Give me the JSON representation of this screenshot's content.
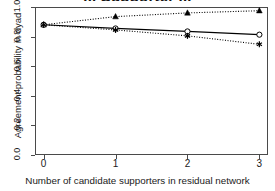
{
  "title": "... Supporter ...",
  "axes": {
    "ylabel": "Agreement probability in dyad",
    "xlabel": "Number of candidate supporters in residual network",
    "y_ticks": [
      "0.0",
      "0.2",
      "0.4",
      "0.6",
      "0.8",
      "1.0"
    ],
    "x_ticks": [
      "0",
      "1",
      "2",
      "3"
    ]
  },
  "chart_data": {
    "type": "line",
    "title": "... Supporter ...",
    "xlabel": "Number of candidate supporters in residual network",
    "ylabel": "Agreement probability in dyad",
    "x": [
      0,
      1,
      2,
      3
    ],
    "xlim": [
      -0.12,
      3.12
    ],
    "ylim": [
      0.0,
      1.0
    ],
    "xticks": [
      0,
      1,
      2,
      3
    ],
    "yticks": [
      0.0,
      0.2,
      0.4,
      0.6,
      0.8,
      1.0
    ],
    "grid": false,
    "legend": "none",
    "series": [
      {
        "name": "triangle-series",
        "marker": "triangle",
        "linestyle": "dotted",
        "color": "#000000",
        "values": [
          0.88,
          0.935,
          0.96,
          0.975
        ]
      },
      {
        "name": "circle-series",
        "marker": "circle-open",
        "linestyle": "solid",
        "color": "#000000",
        "values": [
          0.88,
          0.855,
          0.835,
          0.813
        ]
      },
      {
        "name": "asterisk-series",
        "marker": "asterisk",
        "linestyle": "dotted",
        "color": "#000000",
        "values": [
          0.88,
          0.845,
          0.805,
          0.748
        ]
      }
    ]
  }
}
